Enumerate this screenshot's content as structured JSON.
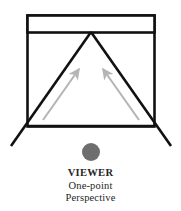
{
  "figure": {
    "title_caption": "VIEWER",
    "caption_lines": [
      "VIEWER",
      "One-point",
      "Perspective"
    ],
    "colors": {
      "background": "#ffffff",
      "frame_stroke": "#111111",
      "sight_line_stroke": "#111111",
      "arrow_gray": "#b5b5b5",
      "viewer_dot": "#6e6e6e",
      "text": "#262626"
    },
    "geometry": {
      "frame": {
        "x": 27,
        "y": 15,
        "width": 128,
        "height": 112
      },
      "lintel_bar": {
        "x": 27,
        "y": 15,
        "width": 128,
        "height": 17
      },
      "vanishing_point": {
        "x": 91,
        "y": 32
      },
      "bottom_left_corner": {
        "x": 27,
        "y": 127
      },
      "bottom_right_corner": {
        "x": 155,
        "y": 127
      },
      "left_extension_end": {
        "x": 11,
        "y": 146
      },
      "right_extension_end": {
        "x": 171,
        "y": 146
      },
      "left_arrow": {
        "x1": 43,
        "y1": 120,
        "x2": 79,
        "y2": 69
      },
      "right_arrow": {
        "x1": 139,
        "y1": 120,
        "x2": 103,
        "y2": 69
      },
      "viewer_dot": {
        "cx": 91,
        "cy": 152,
        "r": 9
      }
    },
    "labels": {
      "frame": "picture-plane-frame",
      "lintel": "horizon-lintel-bar",
      "vanishing_point": "vanishing-point",
      "left_sight_line": "left-receding-edge",
      "right_sight_line": "right-receding-edge",
      "left_arrow": "left-sight-arrow",
      "right_arrow": "right-sight-arrow",
      "viewer": "viewer-position-dot"
    }
  }
}
